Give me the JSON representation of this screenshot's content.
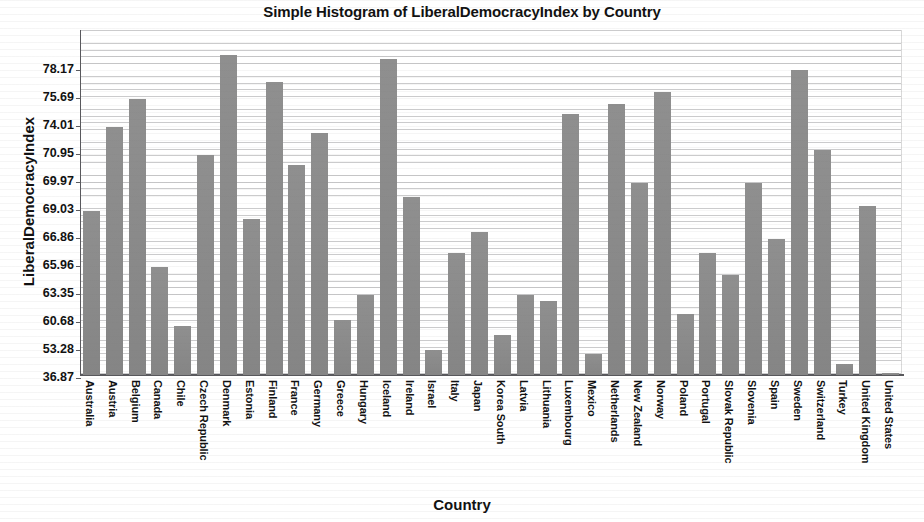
{
  "chart_data": {
    "type": "bar",
    "title": "Simple Histogram of LiberalDemocracyIndex by Country",
    "xlabel": "Country",
    "ylabel": "LiberalDemocracyIndex",
    "grid": true,
    "legend": "none",
    "bar_color": "#8c8c8c",
    "axis_color": "#58585c",
    "ytick_labels": [
      "78.17",
      "75.69",
      "74.01",
      "70.95",
      "69.97",
      "69.03",
      "66.86",
      "65.96",
      "63.35",
      "60.68",
      "53.28",
      "36.87"
    ],
    "ytick_values": [
      78.17,
      75.69,
      74.01,
      70.95,
      69.97,
      69.03,
      66.86,
      65.96,
      63.35,
      60.68,
      53.28,
      36.87
    ],
    "ylim": [
      36.87,
      80.0
    ],
    "categories": [
      "Australia",
      "Austria",
      "Belgium",
      "Canada",
      "Chile",
      "Czech Republic",
      "Denmark",
      "Estonia",
      "Finland",
      "France",
      "Germany",
      "Greece",
      "Hungary",
      "Iceland",
      "Ireland",
      "Israel",
      "Italy",
      "Japan",
      "Korea South",
      "Latvia",
      "Lithuania",
      "Luxembourg",
      "Mexico",
      "Netherlands",
      "New Zealand",
      "Norway",
      "Poland",
      "Portugal",
      "Slovak Republic",
      "Slovenia",
      "Spain",
      "Sweden",
      "Switzerland",
      "Turkey",
      "United Kingdom",
      "United States"
    ],
    "values": [
      69.03,
      74.01,
      75.69,
      65.96,
      59.8,
      70.95,
      79.6,
      68.4,
      77.2,
      70.6,
      73.4,
      61.0,
      63.35,
      79.2,
      69.5,
      53.6,
      66.4,
      67.4,
      57.5,
      63.35,
      62.8,
      74.8,
      51.8,
      75.4,
      69.97,
      76.3,
      61.5,
      66.4,
      65.2,
      69.97,
      66.86,
      78.3,
      71.5,
      45.5,
      69.2,
      40.0
    ]
  }
}
